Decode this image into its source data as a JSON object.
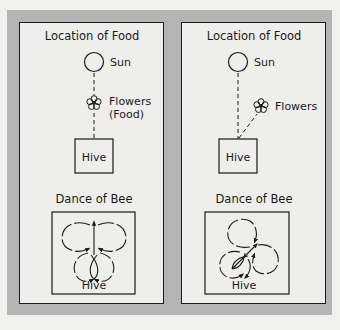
{
  "panels": [
    {
      "id": "left",
      "location_title": "Location of Food",
      "sun_label": "Sun",
      "flowers_label_line1": "Flowers",
      "flowers_label_line2": "(Food)",
      "hive_label": "Hive",
      "dance_title": "Dance of Bee",
      "dance_hive_label": "Hive",
      "waggle_direction": "straight up (toward sun)"
    },
    {
      "id": "right",
      "location_title": "Location of Food",
      "sun_label": "Sun",
      "flowers_label_line1": "Flowers",
      "flowers_label_line2": "",
      "hive_label": "Hive",
      "dance_title": "Dance of Bee",
      "dance_hive_label": "Hive",
      "waggle_direction": "angled up-right (same angle as flowers from sun)"
    }
  ],
  "colors": {
    "page_background": "#f0f0ee",
    "frame_gray": "#b4b4b4",
    "panel_background": "#eeeeec",
    "ink": "#1a1a1a"
  }
}
